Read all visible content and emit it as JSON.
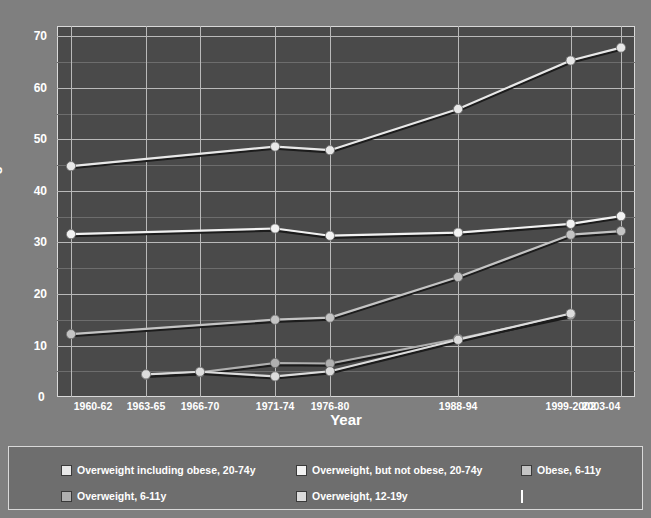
{
  "axis": {
    "ylabel": "Percentage",
    "xlabel": "Year",
    "zero_label": "0",
    "yticks": [
      "10",
      "20",
      "30",
      "40",
      "50",
      "60",
      "70"
    ],
    "xticks": [
      "1960-62",
      "1963-65",
      "1966-70",
      "1971-74",
      "1976-80",
      "1988-94",
      "1999-2002",
      "2003-04"
    ]
  },
  "legend": {
    "items": [
      {
        "label": "Overweight including obese, 20-74y",
        "color": "#e8e8e8"
      },
      {
        "label": "Overweight, but not obese, 20-74y",
        "color": "#f2f2f2"
      },
      {
        "label": "Obese, 6-11y",
        "color": "#c4c4c4"
      },
      {
        "label": "Overweight, 6-11y",
        "color": "#b0b0b0"
      },
      {
        "label": "Overweight, 12-19y",
        "color": "#dcdcdc"
      },
      {
        "label": "",
        "color": "#ffffff"
      }
    ]
  },
  "colors": {
    "plot_background": "#4a4a4a",
    "page_background": "#7f7f7f",
    "gridline": "#b9b9b9",
    "text": "#ffffff"
  },
  "chart_data": {
    "type": "line",
    "title": "",
    "xlabel": "Year",
    "ylabel": "Percentage",
    "ylim": [
      0,
      72
    ],
    "grid": true,
    "legend_position": "bottom",
    "categories": [
      "1960-62",
      "1963-65",
      "1966-70",
      "1971-74",
      "1976-80",
      "1988-94",
      "1999-2002",
      "2003-04"
    ],
    "x_positions": [
      0,
      82,
      141,
      223,
      283,
      423,
      546,
      601
    ],
    "series": [
      {
        "name": "Overweight including obese, 20-74y",
        "color": "#e8e8e8",
        "values": [
          44.8,
          null,
          null,
          48.6,
          47.9,
          55.9,
          65.3,
          67.8
        ]
      },
      {
        "name": "Overweight, but not obese, 20-74y",
        "color": "#f2f2f2",
        "values": [
          31.6,
          null,
          null,
          32.7,
          31.3,
          31.9,
          33.6,
          35.1
        ]
      },
      {
        "name": "Obese, 6-11y",
        "color": "#c4c4c4",
        "values": [
          12.2,
          null,
          null,
          15.0,
          15.4,
          23.3,
          31.5,
          32.2
        ]
      },
      {
        "name": "Overweight, 6-11y",
        "color": "#b0b0b0",
        "values": [
          null,
          4.3,
          4.8,
          6.6,
          6.5,
          11.3,
          15.9,
          null
        ]
      },
      {
        "name": "Overweight, 12-19y",
        "color": "#dcdcdc",
        "values": [
          null,
          4.4,
          4.9,
          4.0,
          5.0,
          11.1,
          16.2,
          null
        ]
      }
    ]
  }
}
